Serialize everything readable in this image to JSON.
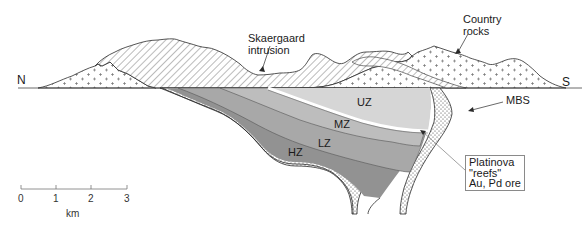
{
  "figure": {
    "type": "geological cross-section",
    "orientation": {
      "left": "N",
      "right": "S"
    }
  },
  "labels": {
    "north": "N",
    "south": "S",
    "skaergaard_line1": "Skaergaard",
    "skaergaard_line2": "intrusion",
    "country_line1": "Country",
    "country_line2": "rocks",
    "mbs": "MBS",
    "uz": "UZ",
    "mz": "MZ",
    "lz": "LZ",
    "hz": "HZ",
    "reef_box": {
      "line1": "Platinova",
      "line2": "\"reefs\"",
      "line3": "Au, Pd ore"
    }
  },
  "scale_bar": {
    "ticks": [
      "0",
      "1",
      "2",
      "3"
    ],
    "unit": "km"
  },
  "colors": {
    "uz": "#d6d6d6",
    "mz": "#bdbdbd",
    "lz": "#a8a8a8",
    "hz": "#929292",
    "reef": "#ffffff",
    "outline": "#2a2a2a",
    "leader": "#8a8a8a"
  }
}
